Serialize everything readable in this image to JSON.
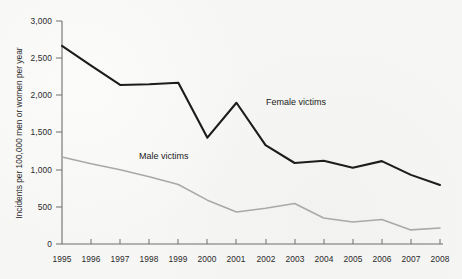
{
  "chart_data": {
    "type": "line",
    "title": "",
    "xlabel": "",
    "ylabel": "Incidents per 100,000 men or women per year",
    "x": [
      1995,
      1996,
      1997,
      1998,
      1999,
      2000,
      2001,
      2002,
      2003,
      2004,
      2005,
      2006,
      2007,
      2008
    ],
    "categories": [
      "1995",
      "1996",
      "1997",
      "1998",
      "1999",
      "2000",
      "2001",
      "2002",
      "2003",
      "2004",
      "2005",
      "2006",
      "2007",
      "2008"
    ],
    "series": [
      {
        "name": "Female victims",
        "color": "#1c1c1c",
        "values": [
          2665,
          2400,
          2140,
          2150,
          2170,
          1430,
          1900,
          1330,
          1090,
          1120,
          1025,
          1115,
          930,
          795
        ]
      },
      {
        "name": "Male victims",
        "color": "#a9a9a9",
        "values": [
          1170,
          1080,
          1000,
          905,
          800,
          590,
          430,
          480,
          545,
          350,
          295,
          330,
          190,
          215
        ]
      }
    ],
    "ylim": [
      0,
      3000
    ],
    "yticks": [
      0,
      500,
      1000,
      1500,
      2000,
      2500,
      3000
    ],
    "ytick_labels": [
      "0",
      "500",
      "1,000",
      "1,500",
      "2,000",
      "2,500",
      "3,000"
    ],
    "xlim": [
      1995,
      2008
    ],
    "grid": false,
    "legend": "inline-annotations",
    "annotations": [
      {
        "text": "Female victims",
        "x_px": 266,
        "y_px": 105
      },
      {
        "text": "Male victims",
        "x_px": 139,
        "y_px": 159
      }
    ],
    "background_color": "#f6f6f5"
  }
}
